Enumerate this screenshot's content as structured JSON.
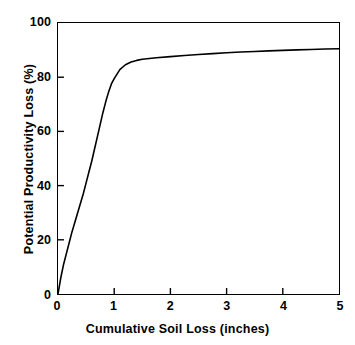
{
  "chart_data": {
    "type": "line",
    "title": "",
    "xlabel": "Cumulative Soil Loss (inches)",
    "ylabel": "Potential Productivity Loss (%)",
    "xlim": [
      0,
      5
    ],
    "ylim": [
      0,
      100
    ],
    "xticks": [
      "0",
      "1",
      "2",
      "3",
      "4",
      "5"
    ],
    "yticks": [
      "0",
      "20",
      "40",
      "60",
      "80",
      "100"
    ],
    "grid": false,
    "legend": null,
    "line_color": "#000000",
    "frame_color": "#000000",
    "background": "#ffffff",
    "series": [
      {
        "name": "Potential Productivity Loss",
        "x": [
          0.0,
          0.05,
          0.1,
          0.15,
          0.2,
          0.25,
          0.3,
          0.35,
          0.4,
          0.45,
          0.5,
          0.55,
          0.6,
          0.65,
          0.7,
          0.75,
          0.8,
          0.85,
          0.9,
          0.95,
          1.0,
          1.1,
          1.2,
          1.3,
          1.4,
          1.5,
          1.75,
          2.0,
          2.25,
          2.5,
          2.75,
          3.0,
          3.25,
          3.5,
          3.75,
          4.0,
          4.25,
          4.5,
          4.75,
          5.0
        ],
        "y": [
          0.0,
          6.0,
          11.0,
          15.0,
          19.0,
          23.0,
          26.5,
          30.0,
          33.5,
          37.0,
          41.0,
          45.0,
          49.0,
          53.5,
          58.0,
          62.5,
          67.0,
          71.0,
          74.5,
          77.5,
          79.5,
          82.8,
          84.6,
          85.6,
          86.2,
          86.6,
          87.2,
          87.6,
          88.0,
          88.4,
          88.7,
          89.0,
          89.3,
          89.5,
          89.7,
          89.9,
          90.1,
          90.2,
          90.4,
          90.5
        ]
      }
    ]
  },
  "ticks": {
    "y": [
      {
        "label": "100",
        "value": 100
      },
      {
        "label": "80",
        "value": 80
      },
      {
        "label": "60",
        "value": 60
      },
      {
        "label": "40",
        "value": 40
      },
      {
        "label": "20",
        "value": 20
      },
      {
        "label": "0",
        "value": 0
      }
    ],
    "x": [
      {
        "label": "0",
        "value": 0
      },
      {
        "label": "1",
        "value": 1
      },
      {
        "label": "2",
        "value": 2
      },
      {
        "label": "3",
        "value": 3
      },
      {
        "label": "4",
        "value": 4
      },
      {
        "label": "5",
        "value": 5
      }
    ]
  }
}
